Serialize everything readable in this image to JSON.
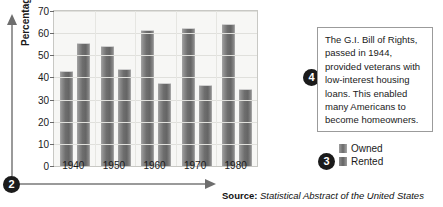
{
  "chart_data": {
    "type": "bar",
    "title": "",
    "xlabel": "",
    "ylabel": "Percentage",
    "categories": [
      "1940",
      "1950",
      "1960",
      "1970",
      "1980"
    ],
    "series": [
      {
        "name": "Owned",
        "values": [
          43,
          54,
          61.5,
          62.5,
          64
        ]
      },
      {
        "name": "Rented",
        "values": [
          55.5,
          44,
          37.5,
          36.5,
          35
        ]
      }
    ],
    "ylim": [
      0,
      70
    ],
    "yticks": [
      0,
      10,
      20,
      30,
      40,
      50,
      60,
      70
    ],
    "grid": true,
    "legend_position": "right-bottom",
    "bar_color": "#6e6e6e",
    "plot_background": "#f7f7f5",
    "gridline_color": "#e0e0dc"
  },
  "axes": {
    "y_axis_label": "Percentage",
    "y_ticks": [
      "70",
      "60",
      "50",
      "40",
      "30",
      "20",
      "10",
      "0"
    ],
    "x_ticks": [
      "1940",
      "1950",
      "1960",
      "1970",
      "1980"
    ]
  },
  "legend": {
    "items": [
      {
        "label": "Owned"
      },
      {
        "label": "Rented"
      }
    ]
  },
  "callouts": {
    "bullet_axis": "2",
    "bullet_legend": "3",
    "bullet_note": "4"
  },
  "note": {
    "text": "The G.I. Bill of Rights, passed in 1944, provided veterans with low-interest housing loans. This enabled many Americans to become homeowners."
  },
  "source": {
    "label": "Source:",
    "value": "Statistical Abstract of the United States"
  }
}
